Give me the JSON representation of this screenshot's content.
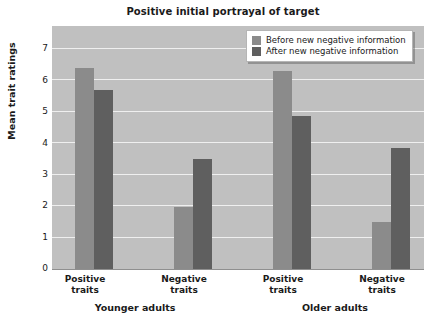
{
  "chart_data": {
    "type": "bar",
    "title": "Positive initial portrayal of target",
    "xlabel": "",
    "ylabel": "Mean trait ratings",
    "ylim": [
      0,
      7.6
    ],
    "yticks": [
      "0",
      "1",
      "2",
      "3",
      "4",
      "5",
      "6",
      "7"
    ],
    "grid": true,
    "legend_position": "top-right",
    "categories": [
      "Positive traits",
      "Negative traits",
      "Positive traits",
      "Negative traits"
    ],
    "group_labels": [
      "Younger adults",
      "Older adults"
    ],
    "series": [
      {
        "name": "Before new negative information",
        "color": "#8b8b8b",
        "values": [
          6.3,
          1.95,
          6.2,
          1.5
        ]
      },
      {
        "name": "After new negative information",
        "color": "#5f5f5f",
        "values": [
          5.6,
          3.45,
          4.8,
          3.8
        ]
      }
    ],
    "plot_background": "#c0c0c0",
    "gridline_color": "#efefef"
  },
  "axis": {
    "y_tick_0": "0",
    "y_tick_1": "1",
    "y_tick_2": "2",
    "y_tick_3": "3",
    "y_tick_4": "4",
    "y_tick_5": "5",
    "y_tick_6": "6",
    "y_tick_7": "7"
  },
  "categories": {
    "c0_line1": "Positive",
    "c0_line2": "traits",
    "c1_line1": "Negative",
    "c1_line2": "traits",
    "c2_line1": "Positive",
    "c2_line2": "traits",
    "c3_line1": "Negative",
    "c3_line2": "traits"
  },
  "groups": {
    "g0": "Younger adults",
    "g1": "Older adults"
  },
  "legend": {
    "entry_before": "Before new negative information",
    "entry_after": "After new negative information"
  }
}
